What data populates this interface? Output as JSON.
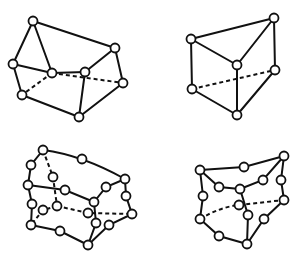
{
  "diagram": {
    "colors": {
      "line": "#111111",
      "node_fill": "#ffffff",
      "background": "#ffffff"
    },
    "node_radius": 4.5,
    "shapes": [
      {
        "name": "linear-pentahedron-top-left",
        "nodes": [
          [
            33,
            21
          ],
          [
            115,
            48
          ],
          [
            13,
            64
          ],
          [
            52,
            73
          ],
          [
            85,
            72
          ],
          [
            123,
            83
          ],
          [
            22,
            95
          ],
          [
            79,
            117
          ]
        ],
        "edges": [
          [
            0,
            1
          ],
          [
            0,
            2
          ],
          [
            0,
            3
          ],
          [
            2,
            3
          ],
          [
            3,
            4
          ],
          [
            4,
            1
          ],
          [
            1,
            5
          ],
          [
            2,
            6
          ],
          [
            6,
            7
          ],
          [
            7,
            5
          ],
          [
            4,
            7
          ]
        ],
        "hidden_edges": [
          [
            3,
            6
          ],
          [
            3,
            5
          ]
        ]
      },
      {
        "name": "linear-wedge-top-right",
        "nodes": [
          [
            191,
            39
          ],
          [
            274,
            18
          ],
          [
            237,
            65
          ],
          [
            275,
            70
          ],
          [
            192,
            89
          ],
          [
            237,
            115
          ]
        ],
        "edges": [
          [
            0,
            1
          ],
          [
            0,
            2
          ],
          [
            2,
            1
          ],
          [
            1,
            3
          ],
          [
            0,
            4
          ],
          [
            2,
            5
          ],
          [
            4,
            5
          ],
          [
            5,
            3
          ]
        ],
        "hidden_edges": [
          [
            4,
            3
          ]
        ]
      },
      {
        "name": "quadratic-pentahedron-bottom-left",
        "nodes": [
          [
            43,
            150
          ],
          [
            82,
            159
          ],
          [
            125,
            179
          ],
          [
            31,
            165
          ],
          [
            28,
            185
          ],
          [
            53,
            177
          ],
          [
            65,
            190
          ],
          [
            94,
            202
          ],
          [
            106,
            187
          ],
          [
            126,
            196
          ],
          [
            132,
            214
          ],
          [
            32,
            204
          ],
          [
            57,
            206
          ],
          [
            43,
            210
          ],
          [
            88,
            213
          ],
          [
            96,
            223
          ],
          [
            109,
            225
          ],
          [
            31,
            225
          ],
          [
            60,
            231
          ],
          [
            88,
            245
          ]
        ],
        "paths": [
          "M43,150 Q82,155 125,179",
          "M43,150 L31,165 L28,185",
          "M28,185 L65,190 L94,202",
          "M94,202 L106,187 L125,179",
          "M125,179 L126,196 L132,214",
          "M28,185 L32,204 L31,225",
          "M31,225 L60,231 L88,245",
          "M88,245 L109,225 L132,214",
          "M94,202 L96,223 L88,245"
        ],
        "hidden_paths": [
          "M43,150 L53,177 L57,206",
          "M57,206 L43,210 L31,225",
          "M57,206 L88,213 L132,214"
        ]
      },
      {
        "name": "quadratic-wedge-bottom-right",
        "nodes": [
          [
            200,
            170
          ],
          [
            244,
            167
          ],
          [
            284,
            156
          ],
          [
            219,
            187
          ],
          [
            240,
            189
          ],
          [
            263,
            180
          ],
          [
            281,
            180
          ],
          [
            203,
            196
          ],
          [
            239,
            205
          ],
          [
            284,
            200
          ],
          [
            248,
            215
          ],
          [
            200,
            219
          ],
          [
            264,
            219
          ],
          [
            219,
            236
          ],
          [
            247,
            244
          ]
        ],
        "paths": [
          "M200,170 L244,167 L284,156",
          "M200,170 L219,187 L240,189",
          "M240,189 L263,180 L284,156",
          "M284,156 L281,180 L284,200",
          "M200,170 L203,196 L200,219",
          "M240,189 L248,215 L247,244",
          "M200,219 L219,236 L247,244",
          "M247,244 L264,219 L284,200"
        ],
        "hidden_paths": [
          "M200,219 Q220,207 239,205 L284,200"
        ]
      }
    ]
  }
}
